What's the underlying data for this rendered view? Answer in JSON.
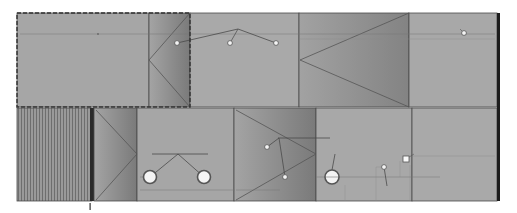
{
  "canvas": {
    "width": 517,
    "height": 213,
    "background": "#ffffff"
  },
  "colors": {
    "panel_light": "#a9a9a9",
    "panel_mid": "#9b9b9b",
    "panel_dark": "#7c7c7c",
    "line": "#4a4a4a",
    "dim_line": "#6a6a6a",
    "edge_dark": "#1c1c1c",
    "handle_fill": "#f4f4f4",
    "handle_stroke": "#555555",
    "selection_dash": "#3a3a3a"
  },
  "drawing": {
    "type": "elevation",
    "top_row": {
      "selected_panel": {
        "x": 17,
        "y": 13,
        "w": 173,
        "h": 94,
        "dashed_selection": true
      },
      "panels": [
        {
          "name": "panel-a",
          "x": 17,
          "y": 13,
          "w": 132,
          "h": 94
        },
        {
          "name": "panel-b-door",
          "x": 149,
          "y": 13,
          "w": 41,
          "h": 94,
          "shaded": true
        },
        {
          "name": "panel-c",
          "x": 190,
          "y": 13,
          "w": 109,
          "h": 94
        },
        {
          "name": "panel-d-door",
          "x": 299,
          "y": 13,
          "w": 110,
          "h": 94,
          "shaded": true
        },
        {
          "name": "panel-e",
          "x": 409,
          "y": 13,
          "w": 88,
          "h": 94
        }
      ],
      "handles": [
        {
          "x": 177,
          "y": 43
        },
        {
          "x": 230,
          "y": 43
        },
        {
          "x": 276,
          "y": 43
        },
        {
          "x": 464,
          "y": 33
        }
      ]
    },
    "bottom_row": {
      "panels": [
        {
          "name": "panel-f-fluted",
          "x": 17,
          "y": 108,
          "w": 75,
          "h": 93,
          "fluted": true
        },
        {
          "name": "panel-g-door",
          "x": 92,
          "y": 108,
          "w": 45,
          "h": 93,
          "shaded": true
        },
        {
          "name": "panel-h",
          "x": 137,
          "y": 108,
          "w": 97,
          "h": 93
        },
        {
          "name": "panel-i-door",
          "x": 234,
          "y": 108,
          "w": 82,
          "h": 93,
          "shaded": true
        },
        {
          "name": "panel-j",
          "x": 316,
          "y": 108,
          "w": 96,
          "h": 93
        },
        {
          "name": "panel-k",
          "x": 412,
          "y": 108,
          "w": 85,
          "h": 93
        }
      ],
      "knobs": [
        {
          "x": 150,
          "y": 177,
          "r": 7
        },
        {
          "x": 204,
          "y": 177,
          "r": 7
        },
        {
          "x": 332,
          "y": 177,
          "r": 7
        }
      ],
      "handles": [
        {
          "x": 267,
          "y": 147
        },
        {
          "x": 285,
          "y": 177
        },
        {
          "x": 384,
          "y": 167
        },
        {
          "x": 406,
          "y": 159,
          "square": true
        }
      ]
    },
    "right_edge_bar": {
      "x": 497,
      "y": 13,
      "w": 3,
      "h": 188
    },
    "marker": {
      "x": 90,
      "y": 204,
      "h": 7
    }
  }
}
